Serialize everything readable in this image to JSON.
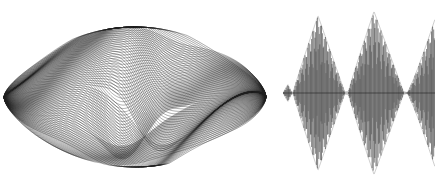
{
  "figure": {
    "width": 435,
    "height": 187,
    "background_color": "#ffffff",
    "ink_color": "#1a1a1a",
    "panel_count": 2,
    "title": "",
    "caption": ""
  },
  "chart_data": [
    {
      "id": "superposition-plot",
      "type": "line",
      "title": "",
      "subtitle": "",
      "xlabel": "",
      "ylabel": "",
      "description": "Dense superposition of many phase-shifted amplitude-modulated sinusoids forming a lens-shaped caustic envelope with an interior butterfly fold",
      "grid": false,
      "axes_visible": false,
      "legend": false,
      "legend_position": "none",
      "plot_box": {
        "x": 4,
        "y": 24,
        "width": 270,
        "height": 146
      },
      "xlim": [
        0,
        1
      ],
      "ylim": [
        -1,
        1
      ],
      "curve_count": 76,
      "samples_per_curve": 420,
      "line_width": 0.55,
      "line_color": "#1f1f1f",
      "line_opacity": 0.72,
      "envelope": {
        "shape": "lens",
        "left_vertex_x": 4,
        "right_vertex_x": 266,
        "center_x": 135,
        "center_y": 97,
        "max_half_height": 70,
        "taper_exponent": 0.62
      },
      "carrier": {
        "base_cycles": 1.0,
        "cycles_spread": 0.62,
        "phase_start": 0.0,
        "phase_end": 3.14159
      },
      "inner_fold": {
        "present": true,
        "lobe_count": 2,
        "apex_y_top": 38,
        "valley_y": 80,
        "left_node_x": 96,
        "right_node_x": 182
      },
      "caustics": [
        {
          "name": "upper-left-fold",
          "x": 48,
          "y": 60,
          "darkness": 0.95
        },
        {
          "name": "upper-right-fold",
          "x": 224,
          "y": 62,
          "darkness": 0.92
        },
        {
          "name": "inner-left-cusp",
          "x": 100,
          "y": 76,
          "darkness": 0.85
        },
        {
          "name": "inner-right-cusp",
          "x": 176,
          "y": 78,
          "darkness": 0.83
        },
        {
          "name": "lower-rim",
          "x": 135,
          "y": 164,
          "darkness": 0.6
        }
      ]
    },
    {
      "id": "oscillogram",
      "type": "line",
      "title": "",
      "subtitle": "",
      "xlabel": "",
      "ylabel": "",
      "description": "Amplitude-modulated carrier oscillogram showing three successive beat bursts separated by near-zero nodes; third burst truncated at the right frame edge",
      "grid": false,
      "axes_visible": false,
      "legend": false,
      "legend_position": "none",
      "baseline_y": 93,
      "plot_box": {
        "x": 283,
        "y": 6,
        "width": 152,
        "height": 175
      },
      "xlim": [
        0,
        1
      ],
      "ylim": [
        -1,
        1
      ],
      "line_width": 0.6,
      "line_color": "#1f1f1f",
      "line_opacity": 0.85,
      "samples": 3400,
      "carrier_cycles": 78,
      "bursts": [
        {
          "name": "precursor",
          "x_start": 283,
          "x_end": 292,
          "peak_x": 288,
          "peak_amplitude": 0.1
        },
        {
          "name": "burst-1",
          "x_start": 293,
          "x_end": 345,
          "peak_x": 318,
          "peak_amplitude": 0.92
        },
        {
          "name": "burst-2",
          "x_start": 348,
          "x_end": 404,
          "peak_x": 374,
          "peak_amplitude": 0.97
        },
        {
          "name": "burst-3",
          "x_start": 407,
          "x_end": 435,
          "peak_x": 435,
          "peak_amplitude": 0.88,
          "truncated": true
        }
      ],
      "nodes_x": [
        292,
        346,
        406
      ]
    }
  ],
  "panels": [
    {
      "name": "superposition-plot",
      "label": "",
      "position": "left"
    },
    {
      "name": "oscillogram",
      "label": "",
      "position": "right"
    }
  ]
}
